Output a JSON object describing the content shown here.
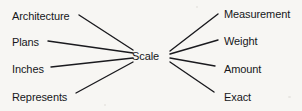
{
  "diagram": {
    "type": "word-web",
    "center": {
      "label": "Scale",
      "x": 150,
      "y": 56
    },
    "branches": [
      {
        "label": "Architecture",
        "side": "left",
        "label_x": 12,
        "label_y": 10,
        "line_from_x": 79,
        "line_from_y": 15,
        "line_to_x": 133,
        "line_to_y": 50
      },
      {
        "label": "Plans",
        "side": "left",
        "label_x": 12,
        "label_y": 36,
        "line_from_x": 48,
        "line_from_y": 41,
        "line_to_x": 133,
        "line_to_y": 53
      },
      {
        "label": "Inches",
        "side": "left",
        "label_x": 12,
        "label_y": 63,
        "line_from_x": 51,
        "line_from_y": 67,
        "line_to_x": 133,
        "line_to_y": 58
      },
      {
        "label": "Represents",
        "side": "left",
        "label_x": 12,
        "label_y": 91,
        "line_from_x": 76,
        "line_from_y": 93,
        "line_to_x": 133,
        "line_to_y": 62
      },
      {
        "label": "Measurement",
        "side": "right",
        "label_x": 224,
        "label_y": 8,
        "line_from_x": 218,
        "line_from_y": 14,
        "line_to_x": 170,
        "line_to_y": 51
      },
      {
        "label": "Weight",
        "side": "right",
        "label_x": 224,
        "label_y": 35,
        "line_from_x": 218,
        "line_from_y": 40,
        "line_to_x": 170,
        "line_to_y": 54
      },
      {
        "label": "Amount",
        "side": "right",
        "label_x": 224,
        "label_y": 63,
        "line_from_x": 215,
        "line_from_y": 66,
        "line_to_x": 170,
        "line_to_y": 58
      },
      {
        "label": "Exact",
        "side": "right",
        "label_x": 224,
        "label_y": 91,
        "line_from_x": 214,
        "line_from_y": 92,
        "line_to_x": 170,
        "line_to_y": 62
      }
    ],
    "colors": {
      "ink": "#16161a",
      "background": "#f7f6f3",
      "line": "#1a1a1e"
    }
  }
}
